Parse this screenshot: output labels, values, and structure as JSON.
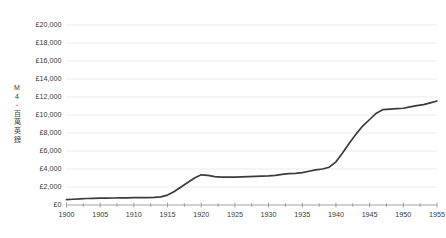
{
  "chart_data": {
    "type": "line",
    "title": "",
    "subtitle": "",
    "xlabel": "",
    "ylabel": "M 4 - 百萬英鎊",
    "ylabel_chars": [
      "M",
      "4",
      "-",
      "百",
      "萬",
      "英",
      "鎊"
    ],
    "xlim": [
      1900,
      1955
    ],
    "ylim": [
      0,
      20000
    ],
    "y_tick_values": [
      0,
      2000,
      4000,
      6000,
      8000,
      10000,
      12000,
      14000,
      16000,
      18000,
      20000
    ],
    "y_tick_labels": [
      "£0",
      "£2,000",
      "£4,000",
      "£6,000",
      "£8,000",
      "£10,000",
      "£12,000",
      "£14,000",
      "£16,000",
      "£18,000",
      "£20,000"
    ],
    "x_tick_values": [
      1900,
      1905,
      1910,
      1915,
      1920,
      1925,
      1930,
      1935,
      1940,
      1945,
      1950,
      1955
    ],
    "x_tick_labels": [
      "1900",
      "1905",
      "1910",
      "1915",
      "1920",
      "1925",
      "1930",
      "1935",
      "1940",
      "1945",
      "1950",
      "1955"
    ],
    "grid": "horizontal",
    "legend": "none",
    "line_color": "#3b3b3b",
    "grid_color": "#e6e6e6",
    "axis_color": "#8c8c8c",
    "text_color": "#3a3a3a",
    "background_color": "#ffffff",
    "currency_symbol": "£",
    "units": "£ millions",
    "series": [
      {
        "name": "National debt",
        "x": [
          1900,
          1901,
          1902,
          1903,
          1904,
          1905,
          1906,
          1907,
          1908,
          1909,
          1910,
          1911,
          1912,
          1913,
          1914,
          1915,
          1916,
          1917,
          1918,
          1919,
          1920,
          1921,
          1922,
          1923,
          1924,
          1925,
          1926,
          1927,
          1928,
          1929,
          1930,
          1931,
          1932,
          1933,
          1934,
          1935,
          1936,
          1937,
          1938,
          1939,
          1940,
          1941,
          1942,
          1943,
          1944,
          1945,
          1946,
          1947,
          1948,
          1949,
          1950,
          1951,
          1952,
          1953,
          1954,
          1955
        ],
        "y": [
          600,
          640,
          680,
          720,
          740,
          760,
          770,
          780,
          790,
          800,
          810,
          820,
          830,
          850,
          900,
          1100,
          1500,
          2000,
          2500,
          3000,
          3350,
          3300,
          3150,
          3100,
          3100,
          3100,
          3120,
          3150,
          3180,
          3200,
          3230,
          3300,
          3400,
          3480,
          3520,
          3600,
          3750,
          3900,
          4000,
          4200,
          4800,
          5800,
          6900,
          7900,
          8800,
          9500,
          10200,
          10600,
          10650,
          10700,
          10750,
          10900,
          11050,
          11150,
          11350,
          11550
        ]
      }
    ]
  },
  "axes": {
    "y_axis_name": "y-axis",
    "x_axis_name": "x-axis"
  }
}
